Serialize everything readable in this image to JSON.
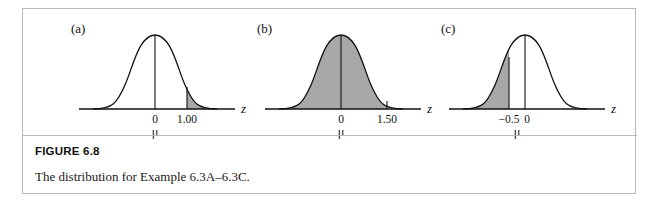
{
  "figure": {
    "number_label": "FIGURE 6.8",
    "caption": "The distribution for Example 6.3A–6.3C.",
    "panels": [
      {
        "label": "(a)",
        "axis_letter": "z",
        "mu_label": "μ",
        "ticks": [
          {
            "value": 0,
            "text": "0"
          },
          {
            "value": 1.0,
            "text": "1.00"
          }
        ],
        "shaded_region": "right tail beyond z = 1.00",
        "shade_from": 1.0,
        "shade_to": 3.2,
        "vertical_lines": [
          0
        ]
      },
      {
        "label": "(b)",
        "axis_letter": "z",
        "mu_label": "μ",
        "ticks": [
          {
            "value": 0,
            "text": "0"
          },
          {
            "value": 1.5,
            "text": "1.50"
          }
        ],
        "shaded_region": "area from left tail up to z = 1.50",
        "shade_from": -3.2,
        "shade_to": 1.5,
        "vertical_lines": [
          0
        ]
      },
      {
        "label": "(c)",
        "axis_letter": "z",
        "mu_label": "μ",
        "ticks": [
          {
            "value": -0.5,
            "text": "−0.5"
          },
          {
            "value": 0,
            "text": "0"
          }
        ],
        "shaded_region": "left tail below z = −0.5",
        "shade_from": -3.2,
        "shade_to": -0.5,
        "vertical_lines": [
          0
        ]
      }
    ]
  },
  "colors": {
    "shade_fill": "#a8a8a8",
    "curve_stroke": "#111111",
    "axis_stroke": "#111111",
    "card_border": "#b9b9b9",
    "background": "#ffffff"
  }
}
